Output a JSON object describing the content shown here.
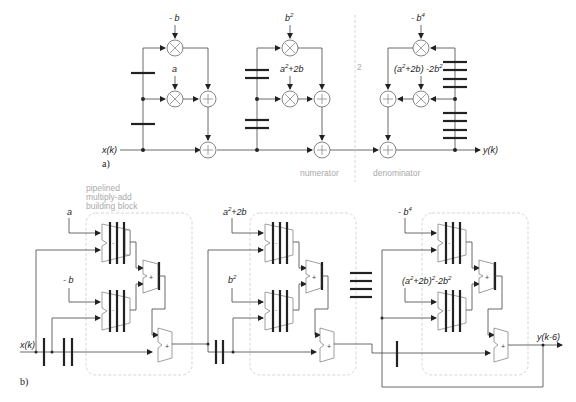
{
  "figure": {
    "part_a": {
      "label": "a)",
      "input": "x(k)",
      "output": "y(k)",
      "section_numerator": "numerator",
      "section_denominator": "denominator",
      "divider_note": "2",
      "coefficients": {
        "neg_b": "- b",
        "a": "a",
        "b2_base": "b",
        "b2_exp": "2",
        "a2_2b_base": "a",
        "a2_2b_exp": "2",
        "a2_2b_rest": "+2b",
        "neg_b4_base": "- b",
        "neg_b4_exp": "4",
        "den_coef": "(a",
        "den_coef_exp": "2",
        "den_coef_rest": "+2b) -2b",
        "den_coef_exp2": "2"
      }
    },
    "part_b": {
      "label": "b)",
      "input": "x(k)",
      "output": "y(k-6)",
      "block_caption": [
        "pipelined",
        "multiply-add",
        "building block"
      ],
      "coefficients": {
        "a": "a",
        "neg_b": "- b",
        "a2_2b_base": "a",
        "a2_2b_exp": "2",
        "a2_2b_rest": "+2b",
        "b2_base": "b",
        "b2_exp": "2",
        "neg_b4_base": "- b",
        "neg_b4_exp": "4",
        "den_coef": "(a",
        "den_coef_exp": "2",
        "den_coef_mid": "+2b)",
        "den_coef_exp2": "2",
        "den_coef_rest": "-2b",
        "den_coef_exp3": "2"
      },
      "operator_symbols": {
        "mult": "·",
        "add": "+"
      }
    }
  }
}
